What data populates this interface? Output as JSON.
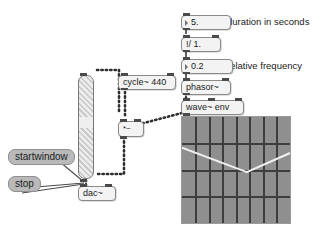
{
  "patch": {
    "objects": [
      {
        "id": "duration_number",
        "name": "number-box-duration",
        "label": "5.",
        "kind": "number"
      },
      {
        "id": "reciprocal_divide",
        "name": "object-reciprocal-divide",
        "label": "!/ 1.",
        "kind": "object"
      },
      {
        "id": "relfreq_number",
        "name": "number-box-relative-frequency",
        "label": "0.2",
        "kind": "number"
      },
      {
        "id": "phasor",
        "name": "object-phasor",
        "label": "phasor~",
        "kind": "object"
      },
      {
        "id": "wave_env",
        "name": "object-wave-env",
        "label": "wave~ env",
        "kind": "object"
      },
      {
        "id": "cycle",
        "name": "object-cycle",
        "label": "cycle~ 440",
        "kind": "object"
      },
      {
        "id": "signal_multiply",
        "name": "object-signal-multiply",
        "label": "*~",
        "kind": "object"
      },
      {
        "id": "dac",
        "name": "object-dac",
        "label": "dac~",
        "kind": "object"
      }
    ],
    "messages": [
      {
        "id": "startwindow",
        "name": "message-startwindow",
        "label": "startwindow"
      },
      {
        "id": "stop",
        "name": "message-stop",
        "label": "stop"
      }
    ],
    "comments": [
      {
        "id": "comment_duration",
        "name": "comment-duration-in-seconds",
        "label": "duration in seconds"
      },
      {
        "id": "comment_relfreq",
        "name": "comment-relative-frequency",
        "label": "relative frequency"
      }
    ],
    "slider": {
      "name": "volume-slider",
      "value_fraction": 0.56
    },
    "colors": {
      "object_fill": "#f3f3f3",
      "object_border": "#8a8a8a",
      "message_fill": "#b9b9b9",
      "display_bg": "#8f8f8f",
      "display_grid": "#3d3d3d",
      "waveform_line": "#f0f0f0",
      "patch_cord": "#3a3a3a"
    }
  },
  "chart_data": {
    "type": "line",
    "xlabel": "",
    "ylabel": "",
    "grid": true,
    "legend": "none",
    "columns": 8,
    "rows": 4,
    "xlim": [
      0,
      1
    ],
    "ylim": [
      -1,
      1
    ],
    "series": [
      {
        "name": "envelope",
        "x": [
          0.0,
          0.6,
          1.0
        ],
        "y": [
          0.42,
          -0.04,
          0.32
        ]
      }
    ]
  }
}
